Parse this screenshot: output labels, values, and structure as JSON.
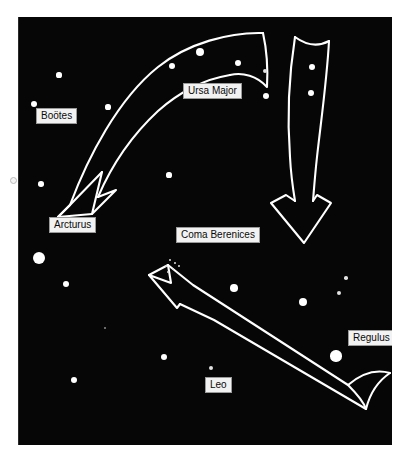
{
  "figure": {
    "kind": "star-chart",
    "background_color": "#060606",
    "page_color": "#ffffff",
    "star_color": "#ffffff",
    "arrow_stroke_color": "#ffffff",
    "label_background": "#f2f2f2",
    "label_text_color": "#0a0a0a",
    "width": 412,
    "height": 471
  },
  "labels": [
    {
      "id": "bootes",
      "text": "Boötes",
      "x": 36,
      "y": 108,
      "w": 52,
      "h": 15
    },
    {
      "id": "ursa-major",
      "text": "Ursa Major",
      "x": 183,
      "y": 83,
      "w": 71,
      "h": 15
    },
    {
      "id": "arcturus",
      "text": "Arcturus",
      "x": 49,
      "y": 217,
      "w": 56,
      "h": 15
    },
    {
      "id": "coma-berenices",
      "text": "Coma Berenices",
      "x": 176,
      "y": 227,
      "w": 90,
      "h": 15
    },
    {
      "id": "regulus",
      "text": "Regulus",
      "x": 348,
      "y": 330,
      "w": 52,
      "h": 15
    },
    {
      "id": "leo",
      "text": "Leo",
      "x": 205,
      "y": 377,
      "w": 27,
      "h": 15
    }
  ],
  "stars": [
    {
      "id": "star-bootes-upper",
      "x": 41,
      "y": 58,
      "r": 2.6
    },
    {
      "id": "star-bootes-left",
      "x": 16,
      "y": 87,
      "r": 3.0
    },
    {
      "id": "star-bootes-right",
      "x": 90,
      "y": 90,
      "r": 2.6
    },
    {
      "id": "star-left-mid",
      "x": 23,
      "y": 167,
      "r": 2.8
    },
    {
      "id": "star-arcturus",
      "x": 21,
      "y": 241,
      "r": 6.4
    },
    {
      "id": "star-left-lower",
      "x": 48,
      "y": 267,
      "r": 3.0
    },
    {
      "id": "star-lower-left",
      "x": 56,
      "y": 363,
      "r": 3.2
    },
    {
      "id": "star-lower-faint",
      "x": 87,
      "y": 311,
      "r": 1.2
    },
    {
      "id": "star-lower-mid",
      "x": 146,
      "y": 340,
      "r": 3.2
    },
    {
      "id": "star-leo-upper",
      "x": 193,
      "y": 351,
      "r": 2.4
    },
    {
      "id": "star-center-field",
      "x": 151,
      "y": 158,
      "r": 2.6
    },
    {
      "id": "star-um-top-left",
      "x": 154,
      "y": 49,
      "r": 3.4
    },
    {
      "id": "star-um-top-mid",
      "x": 182,
      "y": 35,
      "r": 4.4
    },
    {
      "id": "star-um-top-right",
      "x": 220,
      "y": 46,
      "r": 3.2
    },
    {
      "id": "star-between-1",
      "x": 247,
      "y": 54,
      "r": 2.2
    },
    {
      "id": "star-between-2",
      "x": 248,
      "y": 79,
      "r": 3.0
    },
    {
      "id": "star-right-arrow-1",
      "x": 294,
      "y": 50,
      "r": 3.4
    },
    {
      "id": "star-right-arrow-2",
      "x": 293,
      "y": 76,
      "r": 3.4
    },
    {
      "id": "star-right-mid-1",
      "x": 328,
      "y": 261,
      "r": 1.8
    },
    {
      "id": "star-right-mid-2",
      "x": 321,
      "y": 276,
      "r": 2.2
    },
    {
      "id": "star-right-mid-3",
      "x": 380,
      "y": 272,
      "r": 2.8
    },
    {
      "id": "star-right-bright",
      "x": 285,
      "y": 285,
      "r": 4.2
    },
    {
      "id": "star-regulus-small",
      "x": 338,
      "y": 320,
      "r": 2.2
    },
    {
      "id": "star-leo-beam-1",
      "x": 216,
      "y": 271,
      "r": 3.8
    },
    {
      "id": "star-leo-regulus",
      "x": 318,
      "y": 339,
      "r": 5.6
    }
  ],
  "cluster": {
    "id": "coma-berenices-cluster",
    "dots": [
      {
        "x": 152,
        "y": 243,
        "r": 1.1
      },
      {
        "x": 157,
        "y": 246,
        "r": 0.9
      },
      {
        "x": 148,
        "y": 249,
        "r": 1.0
      },
      {
        "x": 155,
        "y": 252,
        "r": 1.1
      },
      {
        "x": 161,
        "y": 249,
        "r": 0.9
      },
      {
        "x": 150,
        "y": 255,
        "r": 0.9
      }
    ]
  },
  "arrows": [
    {
      "id": "ursa-major-arrow",
      "points_to": "Arcturus",
      "description": "curved band sweeping from the Big Dipper down-left to Arcturus"
    },
    {
      "id": "right-arrow",
      "points_to": "down",
      "description": "near-vertical tapered band with notched tail at top descending on the right"
    },
    {
      "id": "leo-arrow",
      "points_to": "Coma Berenices",
      "description": "straight band from Regulus up-left to the Coma Berenices cluster"
    }
  ]
}
